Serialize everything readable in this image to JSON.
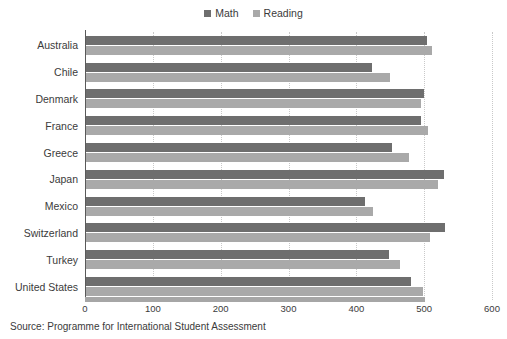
{
  "chart_data": {
    "type": "bar",
    "orientation": "horizontal",
    "title": "",
    "xlabel": "",
    "ylabel": "",
    "xlim": [
      0,
      600
    ],
    "xticks": [
      0,
      100,
      200,
      300,
      400,
      500,
      600
    ],
    "grid": true,
    "legend_position": "top-center",
    "categories": [
      "Australia",
      "Chile",
      "Denmark",
      "France",
      "Greece",
      "Japan",
      "Mexico",
      "Switzerland",
      "Turkey",
      "United States"
    ],
    "series": [
      {
        "name": "Math",
        "color": "#6e6e6e",
        "values": [
          504,
          423,
          500,
          495,
          453,
          529,
          413,
          531,
          448,
          481
        ]
      },
      {
        "name": "Reading",
        "color": "#a9a9a9",
        "values": [
          512,
          449,
          496,
          505,
          477,
          520,
          424,
          509,
          464,
          498
        ]
      }
    ],
    "caption": "Source: Programme for International Student Assessment"
  },
  "legend": {
    "items": [
      {
        "label": "Math",
        "color": "#6e6e6e"
      },
      {
        "label": "Reading",
        "color": "#a9a9a9"
      }
    ]
  },
  "caption": {
    "text": "Source: Programme for International Student Assessment"
  }
}
